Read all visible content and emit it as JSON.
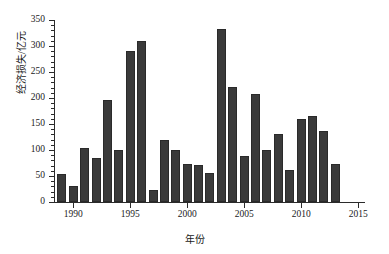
{
  "chart_data": {
    "type": "bar",
    "title": "",
    "xlabel": "年份",
    "ylabel": "经济损失/亿元",
    "categories": [
      1989,
      1990,
      1991,
      1992,
      1993,
      1994,
      1995,
      1996,
      1997,
      1998,
      1999,
      2000,
      2001,
      2002,
      2003,
      2004,
      2005,
      2006,
      2007,
      2008,
      2009,
      2010,
      2011,
      2012,
      2013,
      2014,
      2015
    ],
    "values": [
      54,
      30,
      104,
      85,
      196,
      101,
      290,
      309,
      23,
      120,
      100,
      74,
      71,
      55,
      332,
      221,
      88,
      207,
      101,
      131,
      62,
      159,
      166,
      136,
      73,
      0,
      0
    ],
    "ylim": [
      0,
      350
    ],
    "xlim": [
      1988.4,
      2015.6
    ],
    "ytick_labels": [
      "0",
      "50",
      "100",
      "150",
      "200",
      "250",
      "300",
      "350"
    ],
    "ytick_values": [
      0,
      50,
      100,
      150,
      200,
      250,
      300,
      350
    ],
    "yminor_step": 10,
    "xtick_labels": [
      "1990",
      "1995",
      "2000",
      "2005",
      "2010",
      "2015"
    ],
    "xtick_values": [
      1990,
      1995,
      2000,
      2005,
      2010,
      2015
    ],
    "grid": false,
    "legend": null,
    "bar_color": "#3a3a3a",
    "axis_color": "#2b2b2b",
    "background": "#ffffff",
    "series": [
      {
        "name": "经济损失",
        "points": [
          {
            "year": 1989,
            "value": 54
          },
          {
            "year": 1990,
            "value": 30
          },
          {
            "year": 1991,
            "value": 104
          },
          {
            "year": 1992,
            "value": 85
          },
          {
            "year": 1993,
            "value": 196
          },
          {
            "year": 1994,
            "value": 101
          },
          {
            "year": 1995,
            "value": 290
          },
          {
            "year": 1996,
            "value": 309
          },
          {
            "year": 1997,
            "value": 23
          },
          {
            "year": 1998,
            "value": 120
          },
          {
            "year": 1999,
            "value": 100
          },
          {
            "year": 2000,
            "value": 74
          },
          {
            "year": 2001,
            "value": 71
          },
          {
            "year": 2002,
            "value": 55
          },
          {
            "year": 2003,
            "value": 332
          },
          {
            "year": 2004,
            "value": 221
          },
          {
            "year": 2005,
            "value": 88
          },
          {
            "year": 2006,
            "value": 207
          },
          {
            "year": 2007,
            "value": 101
          },
          {
            "year": 2008,
            "value": 131
          },
          {
            "year": 2009,
            "value": 62
          },
          {
            "year": 2010,
            "value": 159
          },
          {
            "year": 2011,
            "value": 166
          },
          {
            "year": 2012,
            "value": 136
          },
          {
            "year": 2013,
            "value": 73
          }
        ]
      }
    ]
  }
}
